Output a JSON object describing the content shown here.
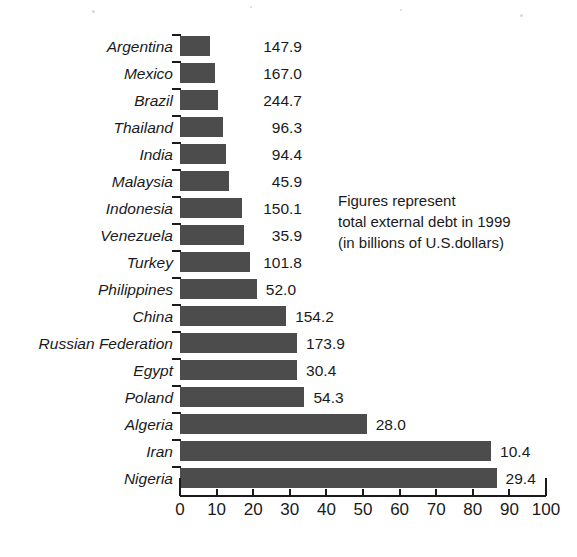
{
  "chart_data": {
    "type": "bar",
    "orientation": "horizontal",
    "title": "",
    "subtitle": "",
    "xlabel": "",
    "ylabel": "",
    "xlim": [
      0,
      100
    ],
    "xticks": [
      0,
      10,
      20,
      30,
      40,
      50,
      60,
      70,
      80,
      90,
      100
    ],
    "xtick_labels": [
      "0",
      "10",
      "20",
      "30",
      "40",
      "50",
      "60",
      "70",
      "80",
      "90",
      "100"
    ],
    "grid": false,
    "legend": null,
    "bar_color": "#4c4c4c",
    "categories": [
      "Argentina",
      "Mexico",
      "Brazil",
      "Thailand",
      "India",
      "Malaysia",
      "Indonesia",
      "Venezuela",
      "Turkey",
      "Philippines",
      "China",
      "Russian Federation",
      "Egypt",
      "Poland",
      "Algeria",
      "Iran",
      "Nigeria"
    ],
    "values": [
      8.3,
      9.5,
      10.5,
      11.7,
      12.5,
      13.5,
      17.0,
      17.5,
      19.0,
      21.0,
      29.0,
      32.0,
      32.0,
      34.0,
      51.0,
      85.0,
      86.5
    ],
    "data_labels": [
      "147.9",
      "167.0",
      "244.7",
      "96.3",
      "94.4",
      "45.9",
      "150.1",
      "35.9",
      "101.8",
      "52.0",
      "154.2",
      "173.9",
      "30.4",
      "54.3",
      "28.0",
      "10.4",
      "29.4"
    ],
    "data_label_values": [
      147.9,
      167.0,
      244.7,
      96.3,
      94.4,
      45.9,
      150.1,
      35.9,
      101.8,
      52.0,
      154.2,
      173.9,
      30.4,
      54.3,
      28.0,
      10.4,
      29.4
    ],
    "annotation": {
      "lines": [
        "Figures represent",
        "total external debt in 1999",
        "(in billions of U.S.dollars)"
      ]
    }
  }
}
